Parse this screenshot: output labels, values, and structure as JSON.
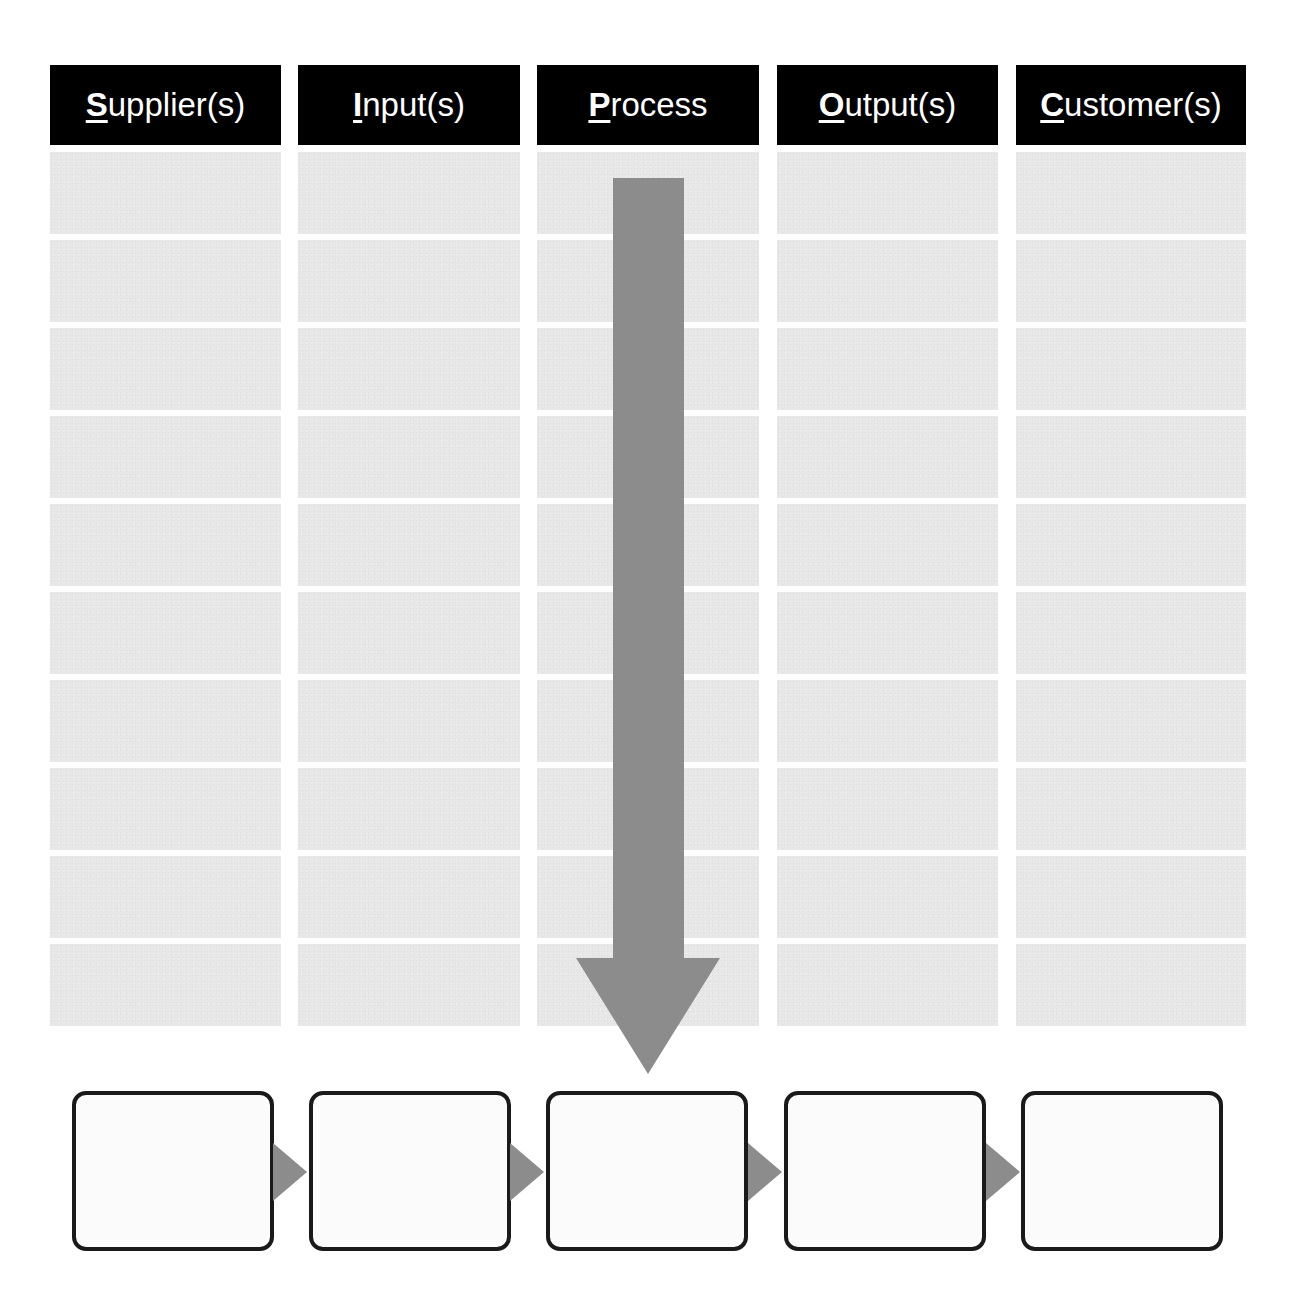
{
  "sipoc": {
    "columns": [
      {
        "key": "S",
        "rest": "upplier(s)",
        "label": "Supplier(s)"
      },
      {
        "key": "I",
        "rest": "nput(s)",
        "label": "Input(s)"
      },
      {
        "key": "P",
        "rest": "rocess",
        "label": "Process"
      },
      {
        "key": "O",
        "rest": "utput(s)",
        "label": "Output(s)"
      },
      {
        "key": "C",
        "rest": "ustomer(s)",
        "label": "Customer(s)"
      }
    ],
    "rows_per_column": 10,
    "cells": [
      [
        "",
        "",
        "",
        "",
        "",
        "",
        "",
        "",
        "",
        ""
      ],
      [
        "",
        "",
        "",
        "",
        "",
        "",
        "",
        "",
        "",
        ""
      ],
      [
        "",
        "",
        "",
        "",
        "",
        "",
        "",
        "",
        "",
        ""
      ],
      [
        "",
        "",
        "",
        "",
        "",
        "",
        "",
        "",
        "",
        ""
      ],
      [
        "",
        "",
        "",
        "",
        "",
        "",
        "",
        "",
        "",
        ""
      ]
    ]
  },
  "process_flow": {
    "steps": [
      "",
      "",
      "",
      "",
      ""
    ],
    "connector_icon": "right-triangle-icon",
    "main_arrow_icon": "down-arrow-icon"
  },
  "colors": {
    "header_bg": "#000000",
    "header_text": "#ffffff",
    "cell_bg": "#e7e7e7",
    "arrow": "#8c8c8c",
    "box_border": "#1a1a1a",
    "box_bg": "#fbfbfb"
  }
}
